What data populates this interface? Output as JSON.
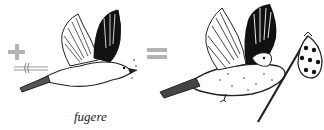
{
  "equation": {
    "operator_plus": "+",
    "operator_equals": "=",
    "caption": "fugere",
    "left_figure": "bird-in-flight-with-arrow",
    "right_figure": "bird-carrying-bindle",
    "colors": {
      "operator": "#b3b3b3",
      "ink": "#111111",
      "background": "#ffffff"
    }
  }
}
